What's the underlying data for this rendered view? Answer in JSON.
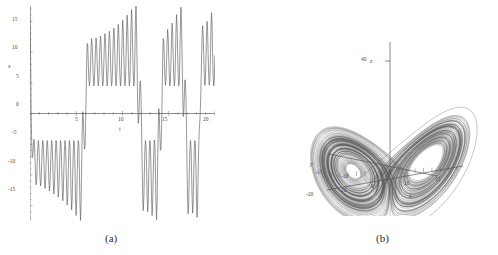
{
  "figure": {
    "background": "#ffffff",
    "stroke": "#585858",
    "panels": [
      {
        "id": "a",
        "caption": "(a)"
      },
      {
        "id": "b",
        "caption": "(b)"
      }
    ]
  },
  "captions": {
    "a": "(a)",
    "b": "(b)"
  },
  "chart_data": [
    {
      "type": "line",
      "id": "lorenz-time-series",
      "title": "",
      "subtitle": "",
      "xlabel": "t",
      "ylabel": "x",
      "xlim": [
        0,
        20
      ],
      "ylim": [
        -17.5,
        17.5
      ],
      "grid": false,
      "legend": "none",
      "xticks": [
        5,
        10,
        15,
        20
      ],
      "xtick_labels": [
        "5",
        "10",
        "15",
        "20"
      ],
      "yticks": [
        15,
        10,
        5,
        0,
        -5,
        -10,
        -15
      ],
      "ytick_labels": [
        "15",
        "10",
        "5",
        "0",
        "-5",
        "-10",
        "-15"
      ],
      "series": [
        {
          "name": "x(t)",
          "color": "#585858",
          "description": "Chaotic Lorenz x-coordinate oscillating between the two attractor lobes",
          "x": [
            0.0,
            0.06,
            0.12,
            0.18,
            0.24,
            0.3,
            0.36,
            0.42,
            0.48,
            0.54,
            0.6,
            0.66,
            0.72,
            0.78,
            0.84,
            0.9,
            0.96,
            1.02,
            1.08,
            1.14,
            1.2,
            1.26,
            1.32,
            1.38,
            1.44,
            1.5,
            1.56,
            1.62,
            1.68,
            1.74,
            1.8,
            1.86,
            1.92,
            1.98,
            2.04,
            2.1,
            2.16,
            2.22,
            2.28,
            2.34,
            2.4,
            2.46,
            2.52,
            2.58,
            2.64,
            2.7,
            2.76,
            2.82,
            2.88,
            2.94,
            3.0,
            3.06,
            3.12,
            3.18,
            3.24,
            3.3,
            3.36,
            3.42,
            3.48,
            3.54,
            3.6,
            3.66,
            3.72,
            3.78,
            3.84,
            3.9,
            3.96,
            4.02,
            4.08,
            4.14,
            4.2,
            4.26,
            4.32,
            4.38,
            4.44,
            4.5,
            4.56,
            4.62,
            4.68,
            4.74,
            4.8,
            4.86,
            4.92,
            4.98,
            5.04,
            5.1,
            5.16,
            5.22,
            5.28,
            5.34,
            5.4,
            5.46,
            5.52,
            5.58,
            5.64,
            5.7,
            5.76,
            5.82,
            5.88,
            5.94,
            6.0,
            6.06,
            6.12,
            6.18,
            6.24,
            6.3,
            6.36,
            6.42,
            6.48,
            6.54,
            6.6,
            6.66,
            6.72,
            6.78,
            6.84,
            6.9,
            6.96,
            7.02,
            7.08,
            7.14,
            7.2,
            7.26,
            7.32,
            7.38,
            7.44,
            7.5,
            7.56,
            7.62,
            7.68,
            7.74,
            7.8,
            7.86,
            7.92,
            7.98,
            8.04,
            8.1,
            8.16,
            8.22,
            8.28,
            8.34,
            8.4,
            8.46,
            8.52,
            8.58,
            8.64,
            8.7,
            8.76,
            8.82,
            8.88,
            8.94,
            9.0,
            9.06,
            9.12,
            9.18,
            9.24,
            9.3,
            9.36,
            9.42,
            9.48,
            9.54,
            9.6,
            9.66,
            9.72,
            9.78,
            9.84,
            9.9,
            9.96,
            10.02,
            10.08,
            10.14,
            10.2,
            10.26,
            10.32,
            10.38,
            10.44,
            10.5,
            10.56,
            10.62,
            10.68,
            10.74,
            10.8,
            10.86,
            10.92,
            10.98,
            11.04,
            11.1,
            11.16,
            11.22,
            11.28,
            11.34,
            11.4,
            11.46,
            11.52,
            11.58,
            11.64,
            11.7,
            11.76,
            11.82,
            11.88,
            11.94,
            12.0,
            12.06,
            12.12,
            12.18,
            12.24,
            12.3,
            12.36,
            12.42,
            12.48,
            12.54,
            12.6,
            12.66,
            12.72,
            12.78,
            12.84,
            12.9,
            12.96,
            13.02,
            13.08,
            13.14,
            13.2,
            13.26,
            13.32,
            13.38,
            13.44,
            13.5,
            13.56,
            13.62,
            13.68,
            13.74,
            13.8,
            13.86,
            13.92,
            13.98,
            14.04,
            14.1,
            14.16,
            14.22,
            14.28,
            14.34,
            14.4,
            14.46,
            14.52,
            14.58,
            14.64,
            14.7,
            14.76,
            14.82,
            14.88,
            14.94,
            15.0,
            15.06,
            15.12,
            15.18,
            15.24,
            15.3,
            15.36,
            15.42,
            15.48,
            15.54,
            15.6,
            15.66,
            15.72,
            15.78,
            15.84,
            15.9,
            15.96,
            16.02,
            16.08,
            16.14,
            16.2,
            16.26,
            16.32,
            16.38,
            16.44,
            16.5,
            16.56,
            16.62,
            16.68,
            16.74,
            16.8,
            16.86,
            16.92,
            16.98,
            17.04,
            17.1,
            17.16,
            17.22,
            17.28,
            17.34,
            17.4,
            17.46,
            17.52,
            17.58,
            17.64,
            17.7,
            17.76,
            17.82,
            17.88,
            17.94,
            18.0,
            18.06,
            18.12,
            18.18,
            18.24,
            18.3,
            18.36,
            18.42,
            18.48,
            18.54,
            18.6,
            18.66,
            18.72,
            18.78,
            18.84,
            18.9,
            18.96,
            19.02,
            19.08,
            19.14,
            19.2,
            19.26,
            19.32,
            19.38,
            19.44,
            19.5,
            19.56,
            19.62,
            19.68,
            19.74,
            19.8,
            19.86,
            19.92,
            19.98
          ],
          "y": [
            17.4,
            10.0,
            1.0,
            -4.6,
            -7.2,
            -7.0,
            -5.4,
            -4.2,
            -5.0,
            -7.4,
            -10.2,
            -11.6,
            -10.8,
            -8.2,
            -5.6,
            -4.4,
            -5.2,
            -7.6,
            -10.4,
            -11.8,
            -11.0,
            -8.4,
            -5.7,
            -4.4,
            -5.2,
            -7.7,
            -10.7,
            -12.2,
            -11.3,
            -8.5,
            -5.7,
            -4.4,
            -5.2,
            -7.8,
            -11.0,
            -12.6,
            -11.6,
            -8.7,
            -5.8,
            -4.4,
            -5.2,
            -7.9,
            -11.3,
            -13.1,
            -12.0,
            -8.9,
            -5.8,
            -4.4,
            -5.2,
            -8.0,
            -11.6,
            -13.6,
            -12.4,
            -9.1,
            -5.9,
            -4.4,
            -5.2,
            -8.2,
            -12.0,
            -14.2,
            -12.9,
            -9.3,
            -6.0,
            -4.4,
            -5.2,
            -8.4,
            -12.5,
            -14.9,
            -13.4,
            -9.5,
            -6.0,
            -4.4,
            -5.2,
            -8.6,
            -13.1,
            -15.7,
            -14.0,
            -9.8,
            -6.1,
            -4.4,
            -5.1,
            -8.9,
            -13.8,
            -16.6,
            -14.7,
            -10.1,
            -6.2,
            -4.4,
            -5.1,
            -9.3,
            -14.6,
            -17.4,
            -14.8,
            -9.0,
            -3.0,
            0.3,
            -0.6,
            -3.4,
            -5.8,
            -5.6,
            -2.6,
            2.2,
            7.6,
            11.4,
            11.2,
            8.4,
            5.7,
            4.5,
            5.3,
            7.8,
            10.8,
            12.2,
            11.3,
            8.5,
            5.8,
            4.5,
            5.3,
            7.8,
            10.9,
            12.3,
            11.4,
            8.6,
            5.8,
            4.5,
            5.3,
            7.9,
            11.1,
            12.6,
            11.6,
            8.7,
            5.8,
            4.5,
            5.3,
            8.0,
            11.3,
            13.0,
            11.9,
            8.8,
            5.9,
            4.5,
            5.3,
            8.1,
            11.6,
            13.4,
            12.2,
            9.0,
            5.9,
            4.5,
            5.3,
            8.2,
            11.9,
            13.9,
            12.6,
            9.2,
            6.0,
            4.5,
            5.3,
            8.4,
            12.3,
            14.5,
            13.1,
            9.4,
            6.1,
            4.5,
            5.3,
            8.6,
            12.8,
            15.2,
            13.6,
            9.6,
            6.1,
            4.5,
            5.2,
            8.8,
            13.4,
            16.0,
            14.2,
            9.9,
            6.2,
            4.5,
            5.2,
            9.1,
            14.1,
            16.9,
            14.9,
            10.2,
            6.3,
            4.5,
            5.2,
            9.5,
            15.0,
            17.5,
            14.0,
            7.8,
            1.6,
            -1.6,
            -0.9,
            1.9,
            4.9,
            5.3,
            2.8,
            -2.0,
            -8.0,
            -13.2,
            -15.8,
            -14.1,
            -9.8,
            -6.1,
            -4.4,
            -5.2,
            -8.7,
            -13.3,
            -16.0,
            -14.2,
            -9.9,
            -6.2,
            -4.4,
            -5.2,
            -8.9,
            -13.8,
            -16.6,
            -14.6,
            -10.0,
            -6.2,
            -4.3,
            -5.0,
            -9.2,
            -14.5,
            -17.3,
            -14.5,
            -8.5,
            -2.4,
            0.8,
            -0.5,
            -3.5,
            -6.0,
            -5.8,
            -2.7,
            2.4,
            8.1,
            12.2,
            11.9,
            8.9,
            6.0,
            4.6,
            5.4,
            8.2,
            11.8,
            13.7,
            12.4,
            9.1,
            6.0,
            4.5,
            5.3,
            8.4,
            12.4,
            14.7,
            13.2,
            9.4,
            6.1,
            4.5,
            5.3,
            8.8,
            13.4,
            16.1,
            14.3,
            10.0,
            6.2,
            4.5,
            5.2,
            9.2,
            14.4,
            17.3,
            15.0,
            9.6,
            4.0,
            -0.5,
            -0.1,
            2.6,
            5.4,
            5.5,
            2.5,
            -2.7,
            -8.8,
            -14.0,
            -16.3,
            -14.3,
            -9.9,
            -6.1,
            -4.4,
            -5.2,
            -8.8,
            -13.5,
            -16.2,
            -14.4,
            -10.0,
            -6.2,
            -4.4,
            -5.1,
            -9.0,
            -14.1,
            -16.9,
            -14.8,
            -9.7,
            -5.4,
            -2.6,
            -1.3,
            0.8,
            4.0,
            8.4,
            12.4,
            14.3,
            12.9,
            9.4,
            6.2,
            4.6,
            5.4,
            8.5,
            12.6,
            15.0,
            13.5,
            9.6,
            6.2,
            4.6,
            5.3,
            8.9,
            13.6,
            16.4,
            14.6,
            10.1,
            6.3,
            4.5,
            5.2,
            9.4,
            14.8,
            17.5,
            14.4,
            7.9,
            1.3,
            -1.9,
            -1.0,
            2.0,
            5.1,
            5.5,
            2.6,
            -2.5,
            -8.6,
            -14.2,
            -16.8,
            -14.8,
            -10.0,
            -6.0,
            -4.1,
            -4.6,
            -8.4,
            -13.5,
            -16.8,
            -14.8,
            -8.3,
            -0.6,
            4.2,
            5.2,
            3.4,
            0.6,
            -0.2,
            2.2,
            7.4,
            12.4
          ]
        }
      ]
    },
    {
      "type": "line",
      "id": "lorenz-attractor-3d",
      "title": "",
      "subtitle": "",
      "projection": "3d",
      "xlabel": "x",
      "ylabel": "y",
      "zlabel": "z",
      "xlim": [
        -20,
        20
      ],
      "ylim": [
        -25,
        25
      ],
      "zlim": [
        0,
        50
      ],
      "grid": false,
      "legend": "none",
      "xticks": [
        -20,
        -10,
        0,
        10,
        15
      ],
      "xtick_labels": [
        "-20",
        "-10",
        "0",
        "10",
        "15"
      ],
      "yticks": [
        -15,
        -10
      ],
      "ytick_labels": [
        "-15",
        "-10"
      ],
      "zticks": [
        40
      ],
      "ztick_labels": [
        "40"
      ],
      "description": "Lorenz butterfly attractor: two lobes of densely wound trajectories meeting at a saddle near the origin",
      "parameters": {
        "sigma": 10,
        "rho": 28,
        "beta": 2.6667
      }
    }
  ]
}
